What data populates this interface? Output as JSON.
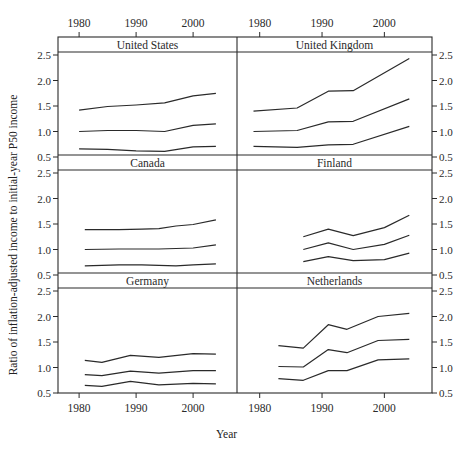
{
  "chart_data": {
    "type": "line",
    "title": "",
    "xlabel": "Year",
    "ylabel": "Ratio of inflation-adjusted income to initial-year P50 income",
    "xlim": [
      1977,
      2007
    ],
    "ylim": [
      0.5,
      2.5
    ],
    "xticks": [
      1980,
      1990,
      2000
    ],
    "yticks": [
      0.5,
      1.0,
      1.5,
      2.0,
      2.5
    ],
    "xtick_labels": [
      "1980",
      "1990",
      "2000"
    ],
    "ytick_labels": [
      "0.5",
      "1.0",
      "1.5",
      "2.0",
      "2.5"
    ],
    "grid": false,
    "layout": "3 rows x 2 columns of facet panels with strip titles",
    "panels": [
      {
        "name": "United States",
        "series": [
          {
            "name": "P90",
            "x": [
              1980,
              1985,
              1990,
              1995,
              2000,
              2004
            ],
            "values": [
              1.42,
              1.49,
              1.52,
              1.56,
              1.7,
              1.75
            ]
          },
          {
            "name": "P50",
            "x": [
              1980,
              1985,
              1990,
              1995,
              2000,
              2004
            ],
            "values": [
              1.0,
              1.02,
              1.02,
              1.0,
              1.12,
              1.15
            ]
          },
          {
            "name": "P10",
            "x": [
              1980,
              1985,
              1990,
              1995,
              2000,
              2004
            ],
            "values": [
              0.66,
              0.65,
              0.62,
              0.61,
              0.7,
              0.71
            ]
          }
        ]
      },
      {
        "name": "United Kingdom",
        "series": [
          {
            "name": "P90",
            "x": [
              1979,
              1986,
              1991,
              1995,
              2004
            ],
            "values": [
              1.4,
              1.46,
              1.79,
              1.8,
              2.43
            ]
          },
          {
            "name": "P50",
            "x": [
              1979,
              1986,
              1991,
              1995,
              2004
            ],
            "values": [
              1.0,
              1.02,
              1.19,
              1.2,
              1.64
            ]
          },
          {
            "name": "P10",
            "x": [
              1979,
              1986,
              1991,
              1995,
              2004
            ],
            "values": [
              0.71,
              0.69,
              0.74,
              0.75,
              1.1
            ]
          }
        ]
      },
      {
        "name": "Canada",
        "series": [
          {
            "name": "P90",
            "x": [
              1981,
              1987,
              1991,
              1994,
              1997,
              2000,
              2004
            ],
            "values": [
              1.39,
              1.39,
              1.4,
              1.41,
              1.46,
              1.49,
              1.58
            ]
          },
          {
            "name": "P50",
            "x": [
              1981,
              1987,
              1991,
              1994,
              1997,
              2000,
              2004
            ],
            "values": [
              1.0,
              1.01,
              1.01,
              1.01,
              1.02,
              1.03,
              1.09
            ]
          },
          {
            "name": "P10",
            "x": [
              1981,
              1987,
              1991,
              1994,
              1997,
              2000,
              2004
            ],
            "values": [
              0.68,
              0.7,
              0.7,
              0.69,
              0.68,
              0.7,
              0.72
            ]
          }
        ]
      },
      {
        "name": "Finland",
        "series": [
          {
            "name": "P90",
            "x": [
              1987,
              1991,
              1995,
              2000,
              2004
            ],
            "values": [
              1.25,
              1.4,
              1.27,
              1.43,
              1.67
            ]
          },
          {
            "name": "P50",
            "x": [
              1987,
              1991,
              1995,
              2000,
              2004
            ],
            "values": [
              1.0,
              1.13,
              1.0,
              1.1,
              1.28
            ]
          },
          {
            "name": "P10",
            "x": [
              1987,
              1991,
              1995,
              2000,
              2004
            ],
            "values": [
              0.76,
              0.86,
              0.78,
              0.8,
              0.93
            ]
          }
        ]
      },
      {
        "name": "Germany",
        "series": [
          {
            "name": "P90",
            "x": [
              1981,
              1984,
              1989,
              1994,
              2000,
              2004
            ],
            "values": [
              1.14,
              1.1,
              1.24,
              1.2,
              1.27,
              1.26
            ]
          },
          {
            "name": "P50",
            "x": [
              1981,
              1984,
              1989,
              1994,
              2000,
              2004
            ],
            "values": [
              0.86,
              0.84,
              0.93,
              0.89,
              0.94,
              0.94
            ]
          },
          {
            "name": "P10",
            "x": [
              1981,
              1984,
              1989,
              1994,
              2000,
              2004
            ],
            "values": [
              0.65,
              0.63,
              0.73,
              0.66,
              0.69,
              0.68
            ]
          }
        ]
      },
      {
        "name": "Netherlands",
        "series": [
          {
            "name": "P90",
            "x": [
              1983,
              1987,
              1991,
              1994,
              1999,
              2004
            ],
            "values": [
              1.43,
              1.38,
              1.84,
              1.75,
              2.0,
              2.06
            ]
          },
          {
            "name": "P50",
            "x": [
              1983,
              1987,
              1991,
              1994,
              1999,
              2004
            ],
            "values": [
              1.02,
              1.01,
              1.35,
              1.29,
              1.53,
              1.55
            ]
          },
          {
            "name": "P10",
            "x": [
              1983,
              1987,
              1991,
              1994,
              1999,
              2004
            ],
            "values": [
              0.78,
              0.75,
              0.94,
              0.94,
              1.15,
              1.17
            ]
          }
        ]
      }
    ]
  },
  "labels": {
    "ylabel": "Ratio of inflation-adjusted income to initial-year P50 income",
    "xlabel": "Year"
  }
}
